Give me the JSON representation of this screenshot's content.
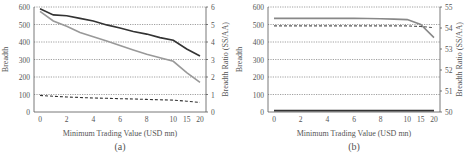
{
  "chart_data": [
    {
      "id": "a",
      "type": "line",
      "caption": "(a)",
      "xlabel": "Minimum Trading Value (USD mn)",
      "ylabel": "Breadth",
      "ylabel_right": "Breadth Ratio (SS/AA)",
      "categories": [
        "0",
        "1",
        "2",
        "3",
        "4",
        "5",
        "6",
        "7",
        "8",
        "9",
        "10",
        "15",
        "20"
      ],
      "xticks": [
        "0",
        "2",
        "4",
        "6",
        "8",
        "10",
        "15",
        "20"
      ],
      "ylim": [
        0,
        600
      ],
      "yticks": [
        "0",
        "100",
        "200",
        "300",
        "400",
        "500",
        "600"
      ],
      "ylim_right": [
        0,
        6
      ],
      "yticks_right": [
        "0",
        "1",
        "2",
        "3",
        "4",
        "5",
        "6"
      ],
      "grid": true,
      "series": [
        {
          "name": "Breadth (dark)",
          "axis": "left",
          "style": "solid",
          "color": "#333333",
          "values": [
            590,
            555,
            550,
            535,
            520,
            498,
            480,
            460,
            445,
            425,
            410,
            360,
            320
          ]
        },
        {
          "name": "Breadth (light)",
          "axis": "left",
          "style": "solid",
          "color": "#999999",
          "values": [
            575,
            520,
            490,
            455,
            430,
            405,
            380,
            355,
            330,
            310,
            290,
            225,
            170
          ]
        },
        {
          "name": "Breadth Ratio",
          "axis": "right",
          "style": "dashed",
          "color": "#333333",
          "values": [
            0.95,
            0.9,
            0.86,
            0.83,
            0.8,
            0.78,
            0.76,
            0.74,
            0.72,
            0.7,
            0.68,
            0.62,
            0.55
          ]
        }
      ]
    },
    {
      "id": "b",
      "type": "line",
      "caption": "(b)",
      "xlabel": "Minimum Trading Value (USD mn)",
      "ylabel": "Breadth",
      "ylabel_right": "Breadth Ratio (SS/AA)",
      "categories": [
        "0",
        "1",
        "2",
        "3",
        "4",
        "5",
        "6",
        "7",
        "8",
        "9",
        "10",
        "15",
        "20"
      ],
      "xticks": [
        "0",
        "2",
        "4",
        "6",
        "8",
        "10",
        "15",
        "20"
      ],
      "ylim": [
        0,
        600
      ],
      "yticks": [
        "0",
        "100",
        "200",
        "300",
        "400",
        "500",
        "600"
      ],
      "ylim_right": [
        50,
        55
      ],
      "yticks_right": [
        "50",
        "51",
        "52",
        "53",
        "54",
        "55"
      ],
      "grid": true,
      "series": [
        {
          "name": "Breadth (light)",
          "axis": "left",
          "style": "solid",
          "color": "#888888",
          "values": [
            535,
            535,
            535,
            535,
            535,
            535,
            535,
            534,
            533,
            531,
            528,
            500,
            425
          ]
        },
        {
          "name": "Breadth (dark)",
          "axis": "left",
          "style": "solid",
          "color": "#333333",
          "values": [
            8,
            8,
            8,
            8,
            8,
            8,
            8,
            8,
            8,
            8,
            8,
            8,
            8
          ]
        },
        {
          "name": "Breadth Ratio",
          "axis": "right",
          "style": "dashed",
          "color": "#555555",
          "values": [
            54.1,
            54.1,
            54.1,
            54.1,
            54.1,
            54.1,
            54.1,
            54.1,
            54.1,
            54.1,
            54.1,
            54.07,
            54.02
          ]
        }
      ]
    }
  ]
}
